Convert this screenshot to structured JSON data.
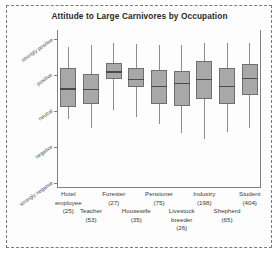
{
  "chart_data": {
    "type": "box",
    "title": "Attitude to Large Carnivores by Occupation",
    "xlabel": "",
    "ylabel": "",
    "grid": false,
    "legend": "none",
    "y_axis": {
      "ticks": [
        "strongly positive",
        "positive",
        "neutral",
        "negative",
        "strongly negative"
      ],
      "tick_values": [
        5,
        4,
        3,
        2,
        1
      ],
      "ylim": [
        1,
        5
      ]
    },
    "categories": [
      "Hotel employee",
      "Teacher",
      "Forester",
      "Housewife",
      "Pensioner",
      "Livestock breeder",
      "Industry",
      "Shepherd",
      "Student"
    ],
    "counts": [
      25,
      53,
      27,
      35,
      75,
      26,
      198,
      65,
      404
    ],
    "boxes": [
      {
        "name": "Hotel employee",
        "n": 25,
        "whisker_low": 2.76,
        "q1": 3.1,
        "median": 3.63,
        "q3": 4.18,
        "whisker_high": 4.78
      },
      {
        "name": "Teacher",
        "n": 53,
        "whisker_low": 2.52,
        "q1": 3.18,
        "median": 3.62,
        "q3": 4.03,
        "whisker_high": 4.82
      },
      {
        "name": "Forester",
        "n": 27,
        "whisker_low": 3.02,
        "q1": 3.88,
        "median": 4.1,
        "q3": 4.33,
        "whisker_high": 4.88
      },
      {
        "name": "Housewife",
        "n": 35,
        "whisker_low": 2.82,
        "q1": 3.65,
        "median": 3.9,
        "q3": 4.2,
        "whisker_high": 4.85
      },
      {
        "name": "Pensioner",
        "n": 75,
        "whisker_low": 2.62,
        "q1": 3.18,
        "median": 3.7,
        "q3": 4.15,
        "whisker_high": 4.82
      },
      {
        "name": "Livestock breeder",
        "n": 26,
        "whisker_low": 2.38,
        "q1": 3.12,
        "median": 3.78,
        "q3": 4.12,
        "whisker_high": 4.82
      },
      {
        "name": "Industry",
        "n": 198,
        "whisker_low": 2.22,
        "q1": 3.32,
        "median": 3.9,
        "q3": 4.38,
        "whisker_high": 4.88
      },
      {
        "name": "Shepherd",
        "n": 65,
        "whisker_low": 2.4,
        "q1": 3.2,
        "median": 3.7,
        "q3": 4.2,
        "whisker_high": 4.88
      },
      {
        "name": "Student",
        "n": 404,
        "whisker_low": 2.52,
        "q1": 3.45,
        "median": 3.92,
        "q3": 4.3,
        "whisker_high": 4.88
      }
    ],
    "colors": {
      "box_fill": "#a8a8a8",
      "box_edge": "#6f6f6f",
      "median": "#4a4a4a",
      "axis": "#808080",
      "frame": "#7a7a7a",
      "title": "#2a2a2a"
    }
  },
  "x_labels": [
    {
      "line1": "Hotel",
      "line2": "employee",
      "line3": "(25)",
      "row": 0
    },
    {
      "line1": "Teacher",
      "line2": "(53)",
      "line3": "",
      "row": 1
    },
    {
      "line1": "Forester",
      "line2": "(27)",
      "line3": "",
      "row": 0
    },
    {
      "line1": "Housewife",
      "line2": "(35)",
      "line3": "",
      "row": 1
    },
    {
      "line1": "Pensioner",
      "line2": "(75)",
      "line3": "",
      "row": 0
    },
    {
      "line1": "Livestock",
      "line2": "breeder",
      "line3": "(26)",
      "row": 1
    },
    {
      "line1": "Industry",
      "line2": "(198)",
      "line3": "",
      "row": 0
    },
    {
      "line1": "Shepherd",
      "line2": "(65)",
      "line3": "",
      "row": 1
    },
    {
      "line1": "Student",
      "line2": "(404)",
      "line3": "",
      "row": 0
    }
  ]
}
